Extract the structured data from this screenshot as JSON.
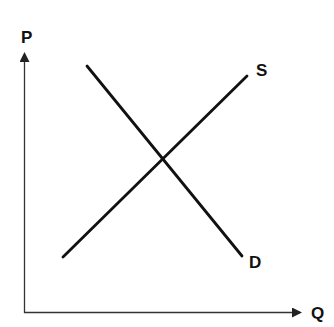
{
  "diagram": {
    "axes": {
      "y_label": "P",
      "x_label": "Q"
    },
    "curves": [
      {
        "name": "supply",
        "label": "S",
        "from": [
          63,
          257
        ],
        "to": [
          247,
          76
        ]
      },
      {
        "name": "demand",
        "label": "D",
        "from": [
          87,
          66
        ],
        "to": [
          242,
          256
        ]
      }
    ],
    "colors": {
      "axis": "#333333",
      "curve": "#111111",
      "background": "#ffffff"
    }
  }
}
